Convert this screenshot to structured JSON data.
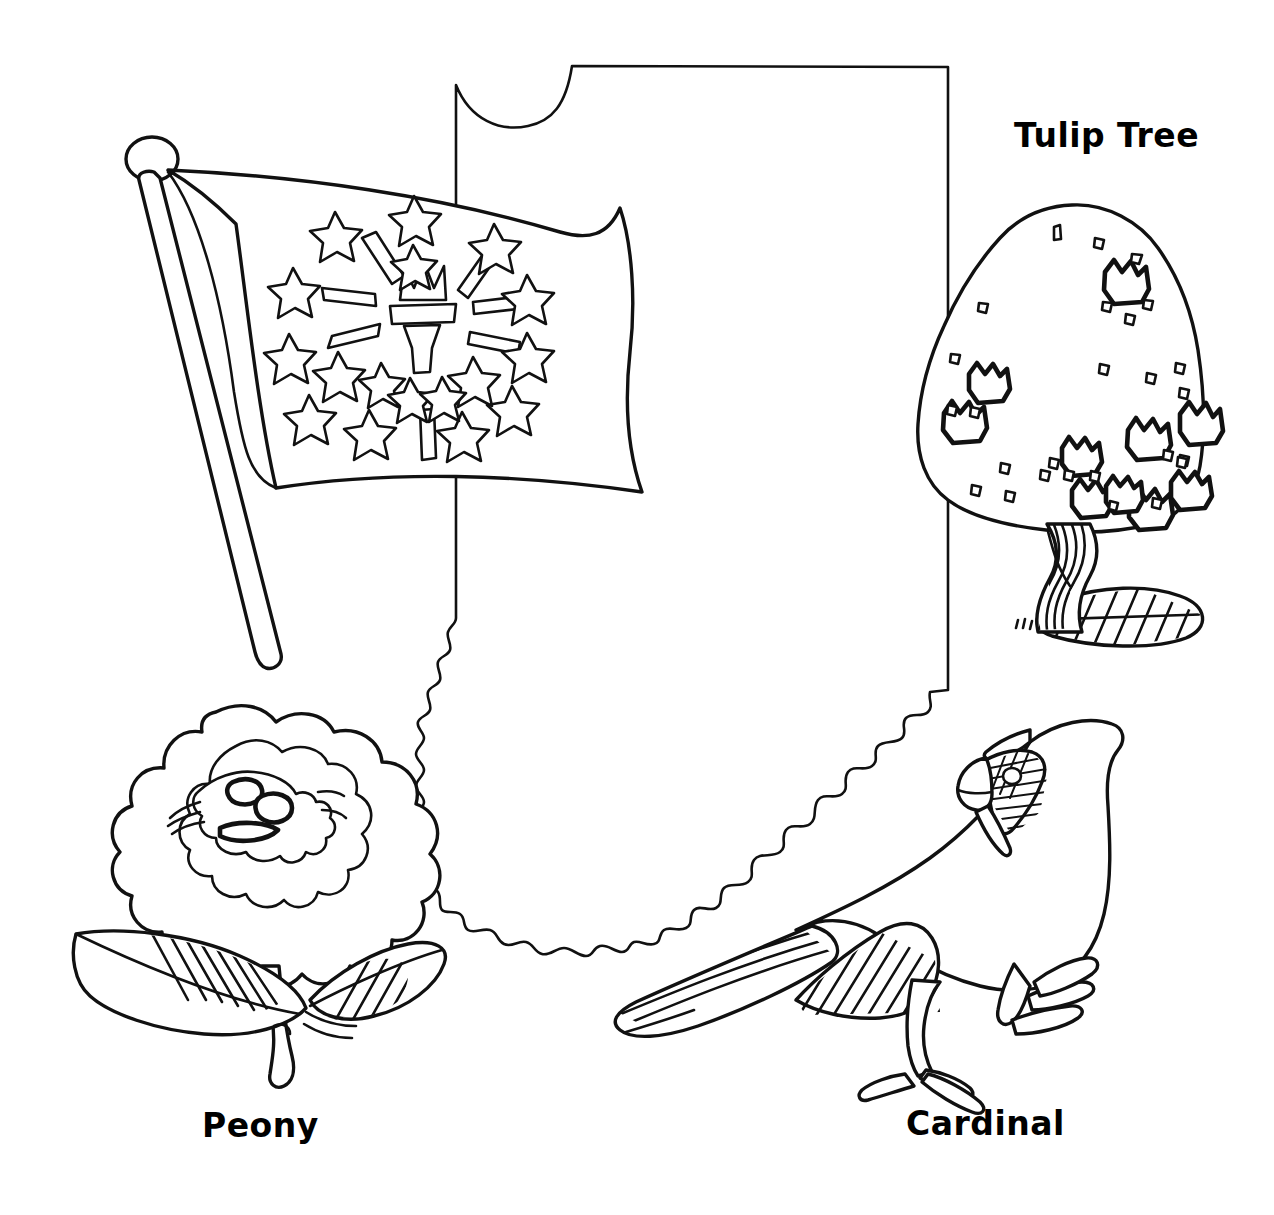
{
  "page": {
    "style": "black and white line-art coloring page",
    "background_color": "#ffffff",
    "ink_color": "#000000",
    "width": 1274,
    "height": 1215
  },
  "labels": {
    "tulip_tree": "Tulip Tree",
    "peony": "Peony",
    "cardinal": "Cardinal"
  },
  "illustrations": {
    "state_outline": {
      "name": "Indiana state outline",
      "notes": "Lake Michigan notch at top-left, straight north and east borders, wavy Wabash River western border and Ohio River southern border"
    },
    "flag": {
      "name": "Indiana state flag",
      "elements": {
        "torch": "flaming torch with rays",
        "stars_outer_count": 13,
        "stars_inner_count": 5,
        "star_top_count": 1,
        "rays_count": 6,
        "pole": "flagpole with round ball finial"
      }
    },
    "tree": {
      "name": "Tulip tree",
      "elements": {
        "canopy": "rounded leafy crown with tulip blossom shapes",
        "trunk": "twisted striped trunk",
        "ground": "hatched cast shadow"
      }
    },
    "flower": {
      "name": "Peony flower",
      "elements": {
        "bloom": "layered ruffled petal rings",
        "center": "small inner petal cluster",
        "leaves": 2,
        "stem": "curved stem"
      }
    },
    "bird": {
      "name": "Northern cardinal",
      "elements": {
        "crest": "pointed head crest",
        "mask": "striped face mask with eye",
        "beak": "conical beak",
        "wing": "hatched wing",
        "tail": "long striped tail",
        "legs": 2
      }
    }
  }
}
